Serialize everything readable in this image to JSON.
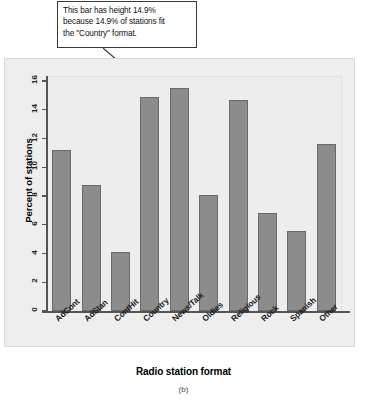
{
  "callout": {
    "lines": [
      "This bar has height 14.9%",
      "because 14.9% of stations fit",
      "the \"Country\" format."
    ],
    "arrow_name": "callout-arrow-to-country-bar"
  },
  "figure": {
    "caption": "(b)"
  },
  "chart_data": {
    "type": "bar",
    "title": "",
    "xlabel": "Radio station format",
    "ylabel": "Percent of stations",
    "categories": [
      "AdCont",
      "AdStan",
      "ContHit",
      "Country",
      "News/Talk",
      "Oldies",
      "Religious",
      "Rock",
      "Spanish",
      "Other"
    ],
    "values": [
      11.2,
      8.8,
      4.1,
      14.9,
      15.5,
      8.1,
      14.7,
      6.8,
      5.6,
      11.6
    ],
    "ylim": [
      0,
      16
    ],
    "yticks": [
      0,
      2,
      4,
      6,
      8,
      10,
      12,
      14,
      16
    ],
    "ytick_labels": [
      "0",
      "2",
      "4",
      "6",
      "8",
      "10",
      "12",
      "14",
      "16"
    ],
    "grid": false,
    "legend": false,
    "bar_color": "#8c8c8c",
    "bar_border_color": "#6a6a6a",
    "panel_color": "#ededed",
    "annotation": "This bar has height 14.9% because 14.9% of stations fit the \"Country\" format.",
    "annotated_category": "Country"
  }
}
